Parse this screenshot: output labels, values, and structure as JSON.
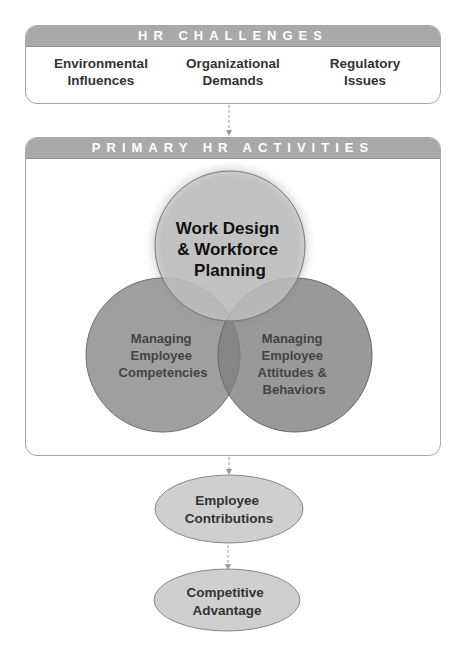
{
  "challenges": {
    "title": "HR CHALLENGES",
    "items": [
      {
        "line1": "Environmental",
        "line2": "Influences"
      },
      {
        "line1": "Organizational",
        "line2": "Demands"
      },
      {
        "line1": "Regulatory",
        "line2": "Issues"
      }
    ]
  },
  "activities": {
    "title": "PRIMARY HR ACTIVITIES",
    "circles": [
      {
        "lines": [
          "Work Design",
          "& Workforce",
          "Planning"
        ]
      },
      {
        "lines": [
          "Managing",
          "Employee",
          "Competencies"
        ]
      },
      {
        "lines": [
          "Managing",
          "Employee",
          "Attitudes &",
          "Behaviors"
        ]
      }
    ]
  },
  "outcomes": [
    {
      "lines": [
        "Employee",
        "Contributions"
      ]
    },
    {
      "lines": [
        "Competitive",
        "Advantage"
      ]
    }
  ],
  "colors": {
    "header_bg": "#a9a9a9",
    "top_circle": "#c4c4c4",
    "left_circle": "#8e8e8e",
    "right_circle": "#7d7d7d",
    "ellipse_fill": "#cfcfcf",
    "connector": "#9a9a9a"
  }
}
